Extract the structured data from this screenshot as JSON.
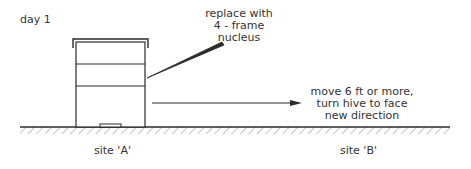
{
  "diagram": {
    "title": "day 1",
    "hive_callout": {
      "lines": [
        "replace with",
        "4 - frame",
        "nucleus"
      ]
    },
    "move_callout": {
      "lines": [
        "move 6 ft or more,",
        "turn hive to face",
        "new direction"
      ]
    },
    "sites": {
      "a": "site 'A'",
      "b": "site 'B'"
    },
    "colors": {
      "line": "#2a2a2a",
      "hatch": "#8a8a8a",
      "background": "#ffffff"
    }
  }
}
